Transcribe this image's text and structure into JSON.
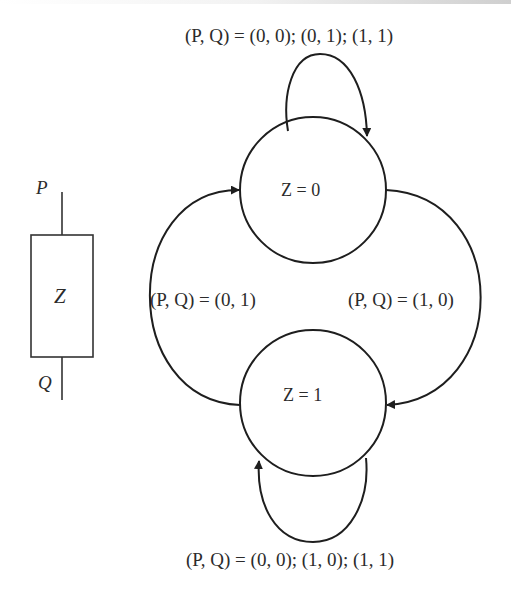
{
  "diagram": {
    "type": "state-transition",
    "component": {
      "label": "Z",
      "input_top": "P",
      "input_bottom": "Q"
    },
    "states": [
      {
        "id": "s0",
        "label": "Z = 0"
      },
      {
        "id": "s1",
        "label": "Z = 1"
      }
    ],
    "transitions": [
      {
        "from": "s0",
        "to": "s0",
        "label": "(P, Q) = (0, 0); (0, 1); (1, 1)"
      },
      {
        "from": "s1",
        "to": "s0",
        "label": "(P, Q) = (0, 1)"
      },
      {
        "from": "s0",
        "to": "s1",
        "label": "(P, Q) = (1, 0)"
      },
      {
        "from": "s1",
        "to": "s1",
        "label": "(P, Q) = (0, 0); (1, 0); (1, 1)"
      }
    ],
    "colors": {
      "stroke": "#1e1e1e",
      "text": "#2b2b2b",
      "background": "#ffffff"
    }
  }
}
